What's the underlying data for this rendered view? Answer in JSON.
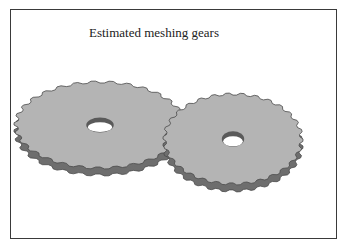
{
  "slide": {
    "title": "Estimated meshing gears",
    "illustration": {
      "subject": "two-meshing-spur-gears",
      "gear_count": 2,
      "colors": {
        "face": "#b4b4b4",
        "side": "#6e6e6e",
        "edge": "#4a4a4a",
        "hole_inner": "#ffffff",
        "hole_wall": "#5a5a5a"
      }
    }
  }
}
